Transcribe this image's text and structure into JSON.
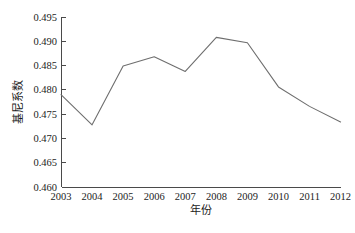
{
  "chart_data": {
    "type": "line",
    "title": "",
    "xlabel": "年份",
    "ylabel": "基尼系数",
    "categories": [
      "2003",
      "2004",
      "2005",
      "2006",
      "2007",
      "2008",
      "2009",
      "2010",
      "2011",
      "2012"
    ],
    "x": [
      2003,
      2004,
      2005,
      2006,
      2007,
      2008,
      2009,
      2010,
      2011,
      2012
    ],
    "values": [
      0.479,
      0.4728,
      0.4849,
      0.4868,
      0.4838,
      0.4908,
      0.4897,
      0.4806,
      0.4766,
      0.4734
    ],
    "series": [
      {
        "name": "基尼系数",
        "values": [
          0.479,
          0.4728,
          0.4849,
          0.4868,
          0.4838,
          0.4908,
          0.4897,
          0.4806,
          0.4766,
          0.4734
        ]
      }
    ],
    "ylim": [
      0.46,
      0.495
    ],
    "xlim": [
      2003,
      2012
    ],
    "ytick_labels": [
      "0.460",
      "0.465",
      "0.470",
      "0.475",
      "0.480",
      "0.485",
      "0.490",
      "0.495"
    ],
    "ytick_values": [
      0.46,
      0.465,
      0.47,
      0.475,
      0.48,
      0.485,
      0.49,
      0.495
    ],
    "xtick_labels": [
      "2003",
      "2004",
      "2005",
      "2006",
      "2007",
      "2008",
      "2009",
      "2010",
      "2011",
      "2012"
    ],
    "grid": false,
    "legend": false,
    "legend_position": "none",
    "line_color": "#6e6e6e",
    "axis_color": "#4a4a4a",
    "background_color": "#ffffff"
  }
}
